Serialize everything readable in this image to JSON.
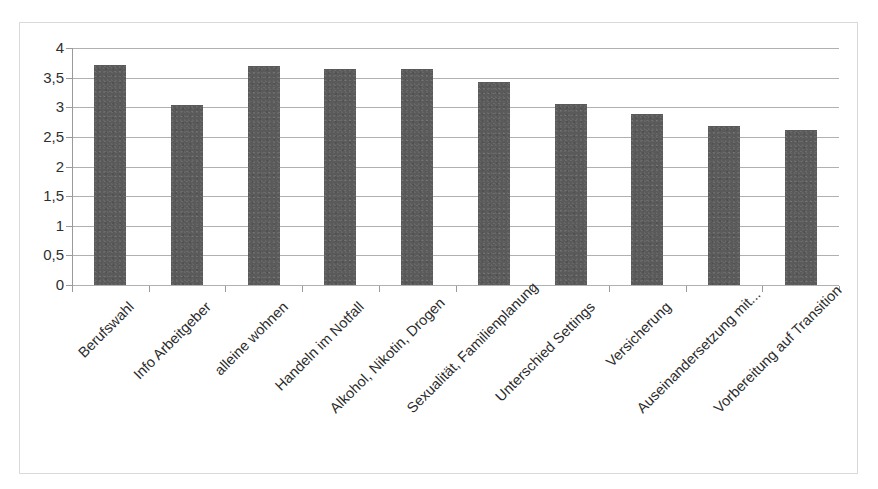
{
  "chart_data": {
    "type": "bar",
    "title": "",
    "subtitle": "",
    "xlabel": "",
    "ylabel": "",
    "ylim": [
      0,
      4
    ],
    "grid": true,
    "legend": false,
    "legend_position": "none",
    "bar_color": "#5a5a5a",
    "orientation": "vertical",
    "y_tick_labels": [
      "4",
      "3,5",
      "3",
      "2,5",
      "2",
      "1,5",
      "1",
      "0,5",
      "0"
    ],
    "y_ticks": [
      4,
      3.5,
      3,
      2.5,
      2,
      1.5,
      1,
      0.5,
      0
    ],
    "categories": [
      "Berufswahl",
      "Info Arbeitgeber",
      "alleine wohnen",
      "Handeln im Notfall",
      "Alkohol, Nikotin, Drogen",
      "Sexualität, Familienplanung",
      "Unterschied Settings",
      "Versicherung",
      "Auseinandersetzung mit...",
      "Vorbereitung auf Transition"
    ],
    "values": [
      3.72,
      3.04,
      3.7,
      3.64,
      3.64,
      3.42,
      3.05,
      2.88,
      2.68,
      2.61
    ]
  },
  "figure": {
    "border_color": "#d9d9d9",
    "background": "#ffffff",
    "gridline_color": "#b0b0b0",
    "axis_color": "#9a9a9a"
  }
}
